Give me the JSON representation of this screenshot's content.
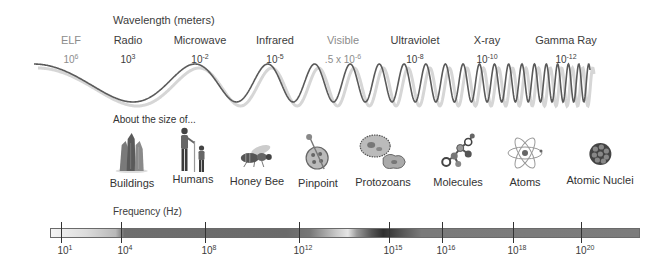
{
  "wavelength": {
    "title": "Wavelength (meters)",
    "bands": [
      {
        "name": "ELF",
        "base": "10",
        "exp": "6",
        "light": true,
        "x": 71
      },
      {
        "name": "Radio",
        "base": "10",
        "exp": "3",
        "light": false,
        "x": 128
      },
      {
        "name": "Microwave",
        "base": "10",
        "exp": "-2",
        "light": false,
        "x": 200
      },
      {
        "name": "Infrared",
        "base": "10",
        "exp": "-5",
        "light": false,
        "x": 275
      },
      {
        "name": "Visible",
        "base": ".5 x 10",
        "exp": "-6",
        "light": true,
        "x": 343
      },
      {
        "name": "Ultraviolet",
        "base": "10",
        "exp": "-8",
        "light": false,
        "x": 415
      },
      {
        "name": "X-ray",
        "base": "10",
        "exp": "-10",
        "light": false,
        "x": 487
      },
      {
        "name": "Gamma Ray",
        "base": "10",
        "exp": "-12",
        "light": false,
        "x": 566
      }
    ]
  },
  "size_comparison": {
    "title": "About the size of...",
    "items": [
      {
        "label": "Buildings",
        "icon": "buildings-icon",
        "x": 132
      },
      {
        "label": "Humans",
        "icon": "humans-icon",
        "x": 193
      },
      {
        "label": "Honey Bee",
        "icon": "honey-bee-icon",
        "x": 257
      },
      {
        "label": "Pinpoint",
        "icon": "pinpoint-icon",
        "x": 318
      },
      {
        "label": "Protozoans",
        "icon": "protozoans-icon",
        "x": 383
      },
      {
        "label": "Molecules",
        "icon": "molecules-icon",
        "x": 458
      },
      {
        "label": "Atoms",
        "icon": "atoms-icon",
        "x": 525
      },
      {
        "label": "Atomic Nuclei",
        "icon": "atomic-nuclei-icon",
        "x": 600
      }
    ]
  },
  "frequency": {
    "title": "Frequency (Hz)",
    "ticks": [
      {
        "base": "10",
        "exp": "1",
        "x": 61
      },
      {
        "base": "10",
        "exp": "4",
        "x": 121
      },
      {
        "base": "10",
        "exp": "8",
        "x": 205
      },
      {
        "base": "10",
        "exp": "12",
        "x": 299
      },
      {
        "base": "10",
        "exp": "15",
        "x": 389
      },
      {
        "base": "10",
        "exp": "16",
        "x": 442
      },
      {
        "base": "10",
        "exp": "18",
        "x": 513
      },
      {
        "base": "10",
        "exp": "20",
        "x": 581
      }
    ]
  },
  "colors": {
    "text": "#3c3c3c",
    "light_text": "#8c8c8c",
    "wave": "#555555",
    "bar_dark": "#6e6e6e"
  }
}
